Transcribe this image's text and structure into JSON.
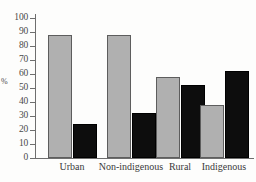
{
  "chart_data": {
    "type": "bar",
    "title": "",
    "xlabel": "",
    "ylabel": "%",
    "ylim": [
      0,
      100
    ],
    "yticks": [
      0,
      10,
      20,
      30,
      40,
      50,
      60,
      70,
      80,
      90,
      100
    ],
    "grid": false,
    "legend": "none",
    "categories": [
      "Urban",
      "Non-indigenous",
      "Rural",
      "Indigenous"
    ],
    "series": [
      {
        "name": "light-grey-series",
        "color": "#b0b0b0",
        "values": [
          88,
          88,
          58,
          38
        ]
      },
      {
        "name": "black-series",
        "color": "#0d0d0d",
        "values": [
          24,
          32,
          52,
          62
        ]
      }
    ]
  },
  "axis": {
    "y_title": "%",
    "tick_labels": [
      "0",
      "10",
      "20",
      "30",
      "40",
      "50",
      "60",
      "70",
      "80",
      "90",
      "100"
    ]
  }
}
